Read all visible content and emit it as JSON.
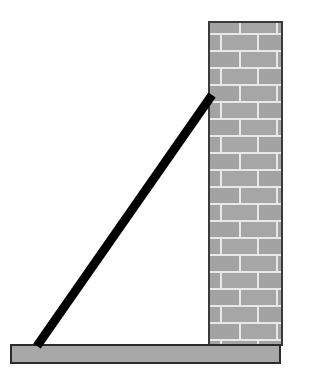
{
  "figure": {
    "type": "physics-diagram",
    "canvas": {
      "width": 311,
      "height": 386,
      "background": "#ffffff"
    }
  },
  "colors": {
    "background": "#ffffff",
    "brick_face": "#a6a6a6",
    "brick_face_dark": "#9a9a9a",
    "mortar": "#e8e8e8",
    "wall_outline": "#3a3a3a",
    "ground_fill": "#a8a8a8",
    "ground_outline": "#2b2b2b",
    "ladder": "#000000"
  },
  "wall": {
    "label": "brick-wall",
    "x": 209,
    "y": 22,
    "width": 73,
    "height": 323,
    "brick_row_height": 17,
    "brick_width": 37,
    "mortar_thickness": 2,
    "row_offset_pattern": "running-bond",
    "row_count": 19
  },
  "ground": {
    "label": "ground-slab",
    "x": 11,
    "y": 345,
    "width": 269,
    "height": 18
  },
  "ladder": {
    "label": "ladder-beam",
    "top_x": 212,
    "top_y": 95,
    "bottom_x": 37,
    "bottom_y": 346,
    "thickness": 9,
    "color": "#000000"
  },
  "chart_data": {
    "type": "diagram",
    "elements": [
      {
        "name": "wall",
        "shape": "rectangle",
        "x": 209,
        "y": 22,
        "w": 73,
        "h": 323,
        "fill": "brick-texture"
      },
      {
        "name": "ground",
        "shape": "rectangle",
        "x": 11,
        "y": 345,
        "w": 269,
        "h": 18,
        "fill": "#a8a8a8"
      },
      {
        "name": "ladder",
        "shape": "line-segment",
        "x1": 212,
        "y1": 95,
        "x2": 37,
        "y2": 346,
        "stroke": "#000000",
        "stroke_width": 9
      }
    ],
    "annotations": [],
    "xlabel": "",
    "ylabel": "",
    "legend": []
  }
}
